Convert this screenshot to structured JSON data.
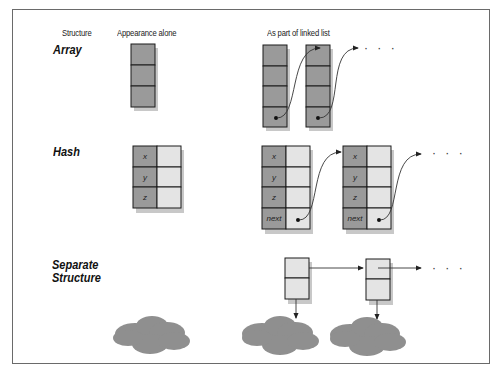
{
  "headers": {
    "structure": "Structure",
    "appearance_alone": "Appearance alone",
    "linked_list": "As part of linked list"
  },
  "rows": [
    {
      "label": "Array"
    },
    {
      "label": "Hash",
      "fields": [
        "x",
        "y",
        "z"
      ],
      "next_field": "next"
    },
    {
      "label_line1": "Separate",
      "label_line2": "Structure"
    }
  ],
  "continuation": "· · ·",
  "colors": {
    "dark_cell": "#9a9a9a",
    "light_cell": "#e4e4e4",
    "cloud": "#8f8f8f",
    "border": "#1a1a1a",
    "shadow": "#c8c8c8"
  }
}
